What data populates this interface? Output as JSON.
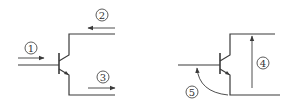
{
  "diagram": {
    "type": "transistor-circuit-comparison",
    "circuits": [
      {
        "id": "left",
        "description": "NPN transistor with current arrows",
        "labels": [
          {
            "id": "1",
            "text": "1",
            "meaning": "base current arrow (rightward)"
          },
          {
            "id": "2",
            "text": "2",
            "meaning": "collector current arrow (leftward)"
          },
          {
            "id": "3",
            "text": "3",
            "meaning": "emitter current arrow (rightward)"
          }
        ]
      },
      {
        "id": "right",
        "description": "NPN transistor with voltage arrows",
        "labels": [
          {
            "id": "4",
            "text": "4",
            "meaning": "collector-emitter voltage arrow (upward)"
          },
          {
            "id": "5",
            "text": "5",
            "meaning": "base-emitter voltage curved arrow"
          }
        ]
      }
    ],
    "colors": {
      "line": "#3a3a3a",
      "background": "#ffffff"
    }
  }
}
